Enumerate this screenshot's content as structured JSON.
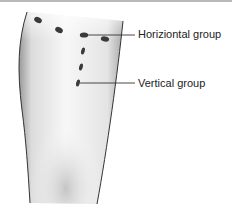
{
  "diagram": {
    "labels": {
      "horizontal": "Horiziontal group",
      "vertical": "Vertical group"
    },
    "groups": {
      "horizontal_dots": [
        [
          38,
          20
        ],
        [
          59,
          30
        ],
        [
          84,
          35
        ],
        [
          105,
          39
        ]
      ],
      "vertical_dots": [
        [
          83,
          51
        ],
        [
          81,
          67
        ],
        [
          78,
          83
        ]
      ]
    },
    "colors": {
      "dot": "#3a3a3a",
      "outline": "#333333",
      "leader_line": "#333333",
      "skin_light": "#f4f4f4",
      "skin_shade": "#bdbdbd"
    }
  }
}
